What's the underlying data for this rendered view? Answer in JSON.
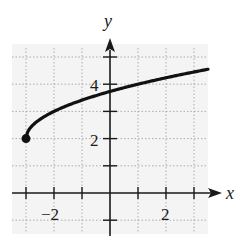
{
  "chart_data": {
    "type": "line",
    "title": "",
    "function": "y = sqrt(x + 3) + 2",
    "xlabel": "x",
    "ylabel": "y",
    "xlim": [
      -3.5,
      3.5
    ],
    "ylim": [
      -1.2,
      5.5
    ],
    "grid": true,
    "grid_style": "dotted",
    "x_tick_labels": [
      {
        "value": -2,
        "label": "−2"
      },
      {
        "value": 2,
        "label": "2"
      }
    ],
    "y_tick_labels": [
      {
        "value": 2,
        "label": "2"
      },
      {
        "value": 4,
        "label": "4"
      }
    ],
    "x_ticks": [
      -3,
      -2,
      -1,
      1,
      2,
      3
    ],
    "y_ticks": [
      -1,
      1,
      2,
      3,
      4,
      5
    ],
    "start_point": {
      "x": -3,
      "y": 2,
      "marker": "filled-circle"
    },
    "series": [
      {
        "name": "f(x)",
        "x": [
          -3,
          -2.9,
          -2.75,
          -2.5,
          -2,
          -1.5,
          -1,
          -0.5,
          0,
          0.5,
          1,
          1.5,
          2,
          2.5,
          3,
          3.5
        ],
        "values": [
          2,
          2.32,
          2.5,
          2.71,
          3,
          3.22,
          3.41,
          3.58,
          3.73,
          3.87,
          4,
          4.12,
          4.24,
          4.35,
          4.45,
          4.55
        ]
      }
    ],
    "colors": {
      "curve": "#111111",
      "axes": "#1a1a1a",
      "grid": "#9a9a9a",
      "background": "#f4f4f4"
    }
  },
  "labels": {
    "x_axis": "x",
    "y_axis": "y",
    "x_neg2": "−2",
    "x_pos2": "2",
    "y_2": "2",
    "y_4": "4"
  }
}
